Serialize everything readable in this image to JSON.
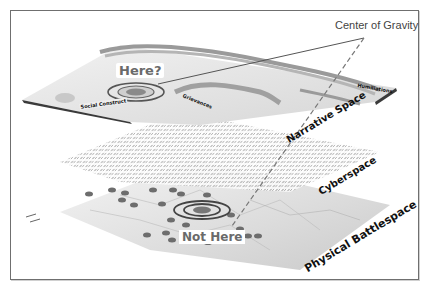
{
  "diagram": {
    "title_annotation": "Center of Gravity",
    "markers": {
      "question": "Here?",
      "negative": "Not Here"
    },
    "layers": [
      {
        "name": "Narrative Space",
        "features": [
          "Social Construct",
          "Grievances",
          "Humiliations"
        ]
      },
      {
        "name": "Cyberspace"
      },
      {
        "name": "Physical Battlespace"
      }
    ],
    "colors": {
      "frame": "#6f6f6f",
      "layer_gray": "#bdbdbd",
      "dark_edge": "#3a3a3a",
      "text_dark": "#111111",
      "marker_text": "#6a6a6a"
    }
  }
}
